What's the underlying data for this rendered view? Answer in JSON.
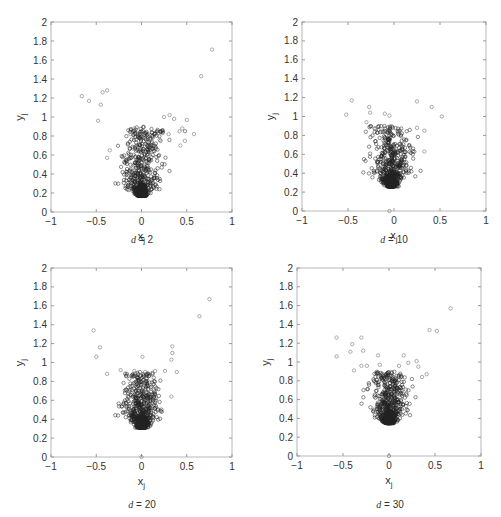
{
  "figure": {
    "panels": [
      {
        "caption_var": "d",
        "caption_eq": " = ",
        "caption_val": "2"
      },
      {
        "caption_var": "d",
        "caption_eq": " = ",
        "caption_val": "10"
      },
      {
        "caption_var": "d",
        "caption_eq": " = ",
        "caption_val": "20"
      },
      {
        "caption_var": "d",
        "caption_eq": " = ",
        "caption_val": "30"
      }
    ]
  },
  "chart_data": [
    {
      "type": "scatter",
      "title": "d = 2",
      "xlabel": "x_j",
      "ylabel": "y_j",
      "xlim": [
        -1,
        1
      ],
      "ylim": [
        0,
        2
      ],
      "xticks": [
        "-1",
        "-0.5",
        "0",
        "0.5",
        "1"
      ],
      "yticks": [
        "0",
        "0.2",
        "0.4",
        "0.6",
        "0.8",
        "1",
        "1.2",
        "1.4",
        "1.6",
        "1.8",
        "2"
      ],
      "grid": false,
      "marker": "open circle",
      "cluster": {
        "x_center": 0.0,
        "y_min": 0.17,
        "y_core": 0.45,
        "spread_x": 0.1,
        "n": 650,
        "seed": 7,
        "tail_slope": 0.9
      },
      "outliers": [
        [
          -0.66,
          1.22
        ],
        [
          -0.58,
          1.17
        ],
        [
          -0.43,
          1.26
        ],
        [
          -0.38,
          1.28
        ],
        [
          -0.45,
          1.13
        ],
        [
          -0.48,
          0.96
        ],
        [
          0.78,
          1.71
        ],
        [
          0.66,
          1.43
        ],
        [
          0.31,
          1.02
        ],
        [
          0.25,
          1.0
        ],
        [
          0.36,
          0.98
        ],
        [
          0.5,
          0.97
        ],
        [
          0.58,
          0.82
        ],
        [
          0.45,
          0.88
        ],
        [
          0.42,
          0.85
        ],
        [
          0.3,
          0.82
        ],
        [
          -0.08,
          0.88
        ],
        [
          -0.12,
          0.82
        ],
        [
          -0.35,
          0.65
        ],
        [
          -0.38,
          0.57
        ],
        [
          0.43,
          0.7
        ],
        [
          0.48,
          0.75
        ],
        [
          0.2,
          0.76
        ]
      ]
    },
    {
      "type": "scatter",
      "title": "d = 10",
      "xlabel": "x_j",
      "ylabel": "y_j",
      "xlim": [
        -1,
        1
      ],
      "ylim": [
        0,
        2
      ],
      "xticks": [
        "-1",
        "-0.5",
        "0",
        "0.5",
        "1"
      ],
      "yticks": [
        "0",
        "0.2",
        "0.4",
        "0.6",
        "0.8",
        "1",
        "1.2",
        "1.4",
        "1.6",
        "1.8",
        "2"
      ],
      "grid": false,
      "marker": "open circle",
      "cluster": {
        "x_center": -0.03,
        "y_min": 0.26,
        "y_core": 0.4,
        "spread_x": 0.1,
        "n": 650,
        "seed": 11,
        "tail_slope": 0.0
      },
      "outliers": [
        [
          -0.46,
          1.17
        ],
        [
          -0.52,
          1.02
        ],
        [
          -0.27,
          1.1
        ],
        [
          -0.26,
          1.04
        ],
        [
          -0.3,
          0.94
        ],
        [
          -0.1,
          1.03
        ],
        [
          -0.05,
          1.01
        ],
        [
          0.25,
          1.16
        ],
        [
          0.41,
          1.1
        ],
        [
          0.52,
          1.0
        ],
        [
          -0.2,
          0.87
        ],
        [
          -0.12,
          0.85
        ],
        [
          0.06,
          0.85
        ],
        [
          0.25,
          0.88
        ],
        [
          0.33,
          0.85
        ],
        [
          0.33,
          0.63
        ],
        [
          -0.05,
          0.0
        ]
      ]
    },
    {
      "type": "scatter",
      "title": "d = 20",
      "xlabel": "x_j",
      "ylabel": "y_j",
      "xlim": [
        -1,
        1
      ],
      "ylim": [
        0,
        2
      ],
      "xticks": [
        "-1",
        "-0.5",
        "0",
        "0.5",
        "1"
      ],
      "yticks": [
        "0",
        "0.2",
        "0.4",
        "0.6",
        "0.8",
        "1",
        "1.2",
        "1.4",
        "1.6",
        "1.8",
        "2"
      ],
      "grid": false,
      "marker": "open circle",
      "cluster": {
        "x_center": 0.0,
        "y_min": 0.31,
        "y_core": 0.42,
        "spread_x": 0.09,
        "n": 650,
        "seed": 21,
        "tail_slope": 0.0
      },
      "outliers": [
        [
          -0.53,
          1.34
        ],
        [
          -0.46,
          1.16
        ],
        [
          -0.5,
          1.06
        ],
        [
          0.01,
          1.06
        ],
        [
          0.34,
          1.17
        ],
        [
          0.34,
          1.1
        ],
        [
          0.33,
          1.03
        ],
        [
          0.64,
          1.49
        ],
        [
          0.75,
          1.67
        ],
        [
          -0.38,
          0.88
        ],
        [
          -0.23,
          0.92
        ],
        [
          -0.08,
          0.91
        ],
        [
          0.04,
          0.9
        ],
        [
          0.15,
          0.91
        ],
        [
          0.26,
          0.91
        ],
        [
          0.39,
          0.9
        ],
        [
          0.33,
          0.64
        ],
        [
          0.0,
          0.0
        ]
      ]
    },
    {
      "type": "scatter",
      "title": "d = 30",
      "xlabel": "x_j",
      "ylabel": "y_j",
      "xlim": [
        -1,
        1
      ],
      "ylim": [
        0,
        2
      ],
      "xticks": [
        "-1",
        "-0.5",
        "0",
        "0.5",
        "1"
      ],
      "yticks": [
        "0",
        "0.2",
        "0.4",
        "0.6",
        "0.8",
        "1",
        "1.2",
        "1.4",
        "1.6",
        "1.8",
        "2"
      ],
      "grid": false,
      "marker": "open circle",
      "cluster": {
        "x_center": 0.0,
        "y_min": 0.35,
        "y_core": 0.45,
        "spread_x": 0.09,
        "n": 650,
        "seed": 30,
        "tail_slope": 0.0
      },
      "outliers": [
        [
          -0.57,
          1.26
        ],
        [
          -0.57,
          1.06
        ],
        [
          -0.3,
          1.26
        ],
        [
          -0.4,
          1.19
        ],
        [
          -0.42,
          1.11
        ],
        [
          -0.28,
          1.12
        ],
        [
          -0.12,
          1.07
        ],
        [
          0.16,
          1.07
        ],
        [
          0.44,
          1.34
        ],
        [
          0.52,
          1.33
        ],
        [
          0.67,
          1.57
        ],
        [
          -0.38,
          0.91
        ],
        [
          -0.3,
          0.96
        ],
        [
          -0.24,
          0.96
        ],
        [
          -0.1,
          0.97
        ],
        [
          0.11,
          0.96
        ],
        [
          0.3,
          1.01
        ],
        [
          0.32,
          0.95
        ],
        [
          0.41,
          0.87
        ],
        [
          0.36,
          0.84
        ],
        [
          0.21,
          0.99
        ],
        [
          0.0,
          0.0
        ]
      ]
    }
  ]
}
